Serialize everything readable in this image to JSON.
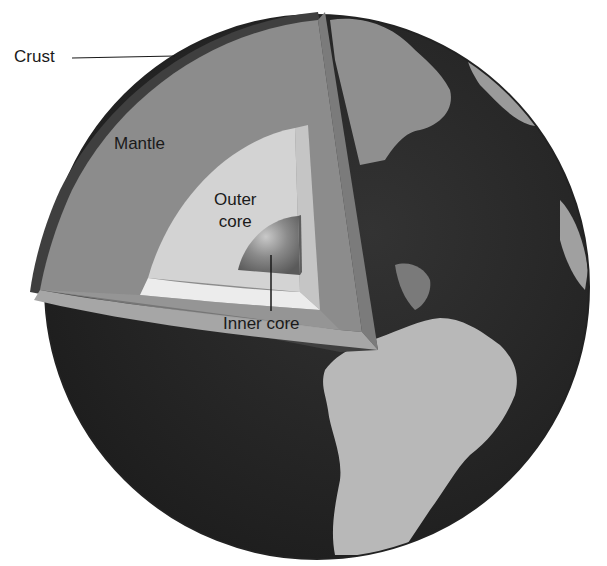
{
  "figure": {
    "labels": {
      "crust": "Crust",
      "mantle": "Mantle",
      "outer_core_line1": "Outer",
      "outer_core_line2": "core",
      "inner_core": "Inner core"
    },
    "colors": {
      "background": "#ffffff",
      "ocean": "#2b2b2b",
      "land": "#b5b5b5",
      "crust": "#3a3a3a",
      "mantle": "#8a8a8a",
      "mantle_cut_face": "#a3a3a3",
      "outer_core": "#d6d6d6",
      "outer_core_cut_face": "#e8e8e8",
      "inner_core": "#6e6e6e",
      "label_text": "#1a1a1a",
      "leader_line": "#1a1a1a"
    }
  }
}
